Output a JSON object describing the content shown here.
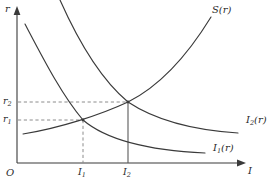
{
  "figure": {
    "type": "economics-diagram",
    "background_color": "#ffffff",
    "line_color": "#3a3a3a",
    "dash_color": "#8c8c8c"
  },
  "axes": {
    "y_label": "r",
    "x_label": "I",
    "origin_label": "O",
    "y_axis_x": 17,
    "x_axis_y": 163,
    "x_axis_end": 243,
    "y_axis_top": 8
  },
  "ticks": {
    "y": [
      {
        "id": "r1",
        "base": "r",
        "sub": "1",
        "value_y": 120
      },
      {
        "id": "r2",
        "base": "r",
        "sub": "2",
        "value_y": 102
      }
    ],
    "x": [
      {
        "id": "I1",
        "base": "I",
        "sub": "1",
        "value_x": 83
      },
      {
        "id": "I2",
        "base": "I",
        "sub": "2",
        "value_x": 128
      }
    ]
  },
  "curves": [
    {
      "id": "S",
      "base": "S",
      "sub": "",
      "arg": "(r)",
      "label": "S(r)",
      "shape": "upward-sloping savings curve",
      "label_x": 212,
      "label_y": 5
    },
    {
      "id": "I2curve",
      "base": "I",
      "sub": "2",
      "arg": "(r)",
      "label": "I2(r)",
      "shape": "downward-sloping convex investment demand curve, shifted right",
      "label_x": 246,
      "label_y": 115
    },
    {
      "id": "I1curve",
      "base": "I",
      "sub": "1",
      "arg": "(r)",
      "label": "I1(r)",
      "shape": "downward-sloping convex investment demand curve",
      "label_x": 213,
      "label_y": 143
    }
  ],
  "equilibria": [
    {
      "id": "E1",
      "x": 83,
      "y": 120,
      "interest": "r1",
      "investment": "I1"
    },
    {
      "id": "E2",
      "x": 128,
      "y": 102,
      "interest": "r2",
      "investment": "I2"
    }
  ]
}
